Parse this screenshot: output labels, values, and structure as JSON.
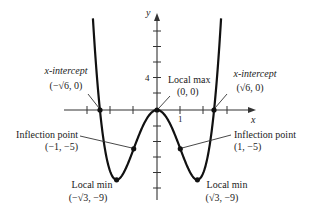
{
  "figure": {
    "function": "f(x) = x^4 - 6x^2",
    "axes": {
      "x_label": "x",
      "y_label": "y",
      "x_tick_label": "1",
      "y_tick_label": "4",
      "x_ticks": [
        -3,
        -2,
        -1,
        0,
        1,
        2,
        3
      ],
      "y_ticks": [
        10,
        8,
        6,
        4,
        2,
        0,
        -2,
        -4,
        -6,
        -8,
        -10
      ]
    },
    "annotations": {
      "x_intercept_left": {
        "title": "x-intercept",
        "coords": "(−√6, 0)"
      },
      "x_intercept_right": {
        "title": "x-intercept",
        "coords": "(√6, 0)"
      },
      "local_max": {
        "title": "Local max",
        "coords": "(0, 0)"
      },
      "inflection_left": {
        "title": "Inflection point",
        "coords": "(−1, −5)"
      },
      "inflection_right": {
        "title": "Inflection point",
        "coords": "(1, −5)"
      },
      "local_min_left": {
        "title": "Local min",
        "coords": "(−√3, −9)"
      },
      "local_min_right": {
        "title": "Local min",
        "coords": "(√3, −9)"
      }
    },
    "colors": {
      "curve": "#111111",
      "axis": "#333333",
      "text": "#222222"
    }
  },
  "chart_data": {
    "type": "line",
    "title": "",
    "xlabel": "x",
    "ylabel": "y",
    "equation": "y = x^4 - 6x^2",
    "xlim": [
      -4,
      4.2
    ],
    "ylim": [
      -12,
      12
    ],
    "grid": false,
    "key_points": [
      {
        "label": "x-intercept",
        "x": -2.449,
        "y": 0,
        "display": "(−√6, 0)"
      },
      {
        "label": "Local min",
        "x": -1.732,
        "y": -9,
        "display": "(−√3, −9)"
      },
      {
        "label": "Inflection point",
        "x": -1,
        "y": -5,
        "display": "(−1, −5)"
      },
      {
        "label": "Local max",
        "x": 0,
        "y": 0,
        "display": "(0, 0)"
      },
      {
        "label": "Inflection point",
        "x": 1,
        "y": -5,
        "display": "(1, −5)"
      },
      {
        "label": "Local min",
        "x": 1.732,
        "y": -9,
        "display": "(√3, −9)"
      },
      {
        "label": "x-intercept",
        "x": 2.449,
        "y": 0,
        "display": "(√6, 0)"
      }
    ],
    "tick_labels": {
      "x": [
        "1"
      ],
      "y": [
        "4"
      ]
    }
  }
}
